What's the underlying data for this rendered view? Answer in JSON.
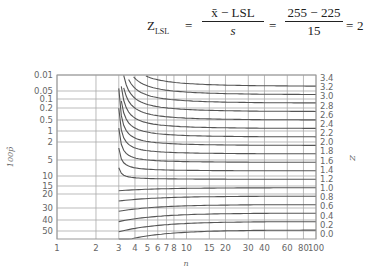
{
  "formula": {
    "lhs": "Z",
    "lhs_sub": "LSL",
    "frac1_num": "x̄ − LSL",
    "frac1_den": "s",
    "frac2_num": "255 − 225",
    "frac2_den": "15",
    "result": "2",
    "equals": "="
  },
  "chart_data": {
    "type": "line",
    "title": "",
    "xlabel": "n",
    "ylabel": "100p̂",
    "y2label": "Z",
    "x_scale": "log",
    "y_scale": "normal-probability (inverted)",
    "x_ticks": [
      "1",
      "2",
      "3",
      "4",
      "5",
      "6",
      "7",
      "8",
      "10",
      "15",
      "20",
      "30",
      "40",
      "60",
      "80",
      "100"
    ],
    "x_tick_values": [
      1,
      2,
      3,
      4,
      5,
      6,
      7,
      8,
      10,
      15,
      20,
      30,
      40,
      60,
      80,
      100
    ],
    "y_ticks": [
      "0.01",
      "0.05",
      "0.1",
      "0.2",
      "0.5",
      "1",
      "2",
      "5",
      "10",
      "15",
      "20",
      "30",
      "40",
      "50"
    ],
    "y_tick_values": [
      0.01,
      0.05,
      0.1,
      0.2,
      0.5,
      1,
      2,
      5,
      10,
      15,
      20,
      30,
      40,
      50
    ],
    "y2_ticks": [
      "3.4",
      "3.2",
      "3.0",
      "2.8",
      "2.6",
      "2.4",
      "2.2",
      "2.0",
      "1.8",
      "1.6",
      "1.4",
      "1.2",
      "1.0",
      "0.8",
      "0.6",
      "0.4",
      "0.2",
      "0.0"
    ],
    "xlim": [
      1,
      100
    ],
    "ylim": [
      0.01,
      50
    ],
    "grid": true,
    "legend": "none",
    "series_description": "One curve per Z value (0.0 to 3.4 step 0.2). Each curve starts at n=3 and approaches the asymptote 100·(1−Φ(Z)) as n→100. Curves for Z≥1.2 descend from the top; curves for Z≤1.0 rise from lower values.",
    "series": [
      {
        "name": "Z=3.4",
        "asymptote_pct": 0.034
      },
      {
        "name": "Z=3.2",
        "asymptote_pct": 0.069
      },
      {
        "name": "Z=3.0",
        "asymptote_pct": 0.135
      },
      {
        "name": "Z=2.8",
        "asymptote_pct": 0.256
      },
      {
        "name": "Z=2.6",
        "asymptote_pct": 0.466
      },
      {
        "name": "Z=2.4",
        "asymptote_pct": 0.82
      },
      {
        "name": "Z=2.2",
        "asymptote_pct": 1.39
      },
      {
        "name": "Z=2.0",
        "asymptote_pct": 2.28
      },
      {
        "name": "Z=1.8",
        "asymptote_pct": 3.59
      },
      {
        "name": "Z=1.6",
        "asymptote_pct": 5.48
      },
      {
        "name": "Z=1.4",
        "asymptote_pct": 8.08
      },
      {
        "name": "Z=1.2",
        "asymptote_pct": 11.5
      },
      {
        "name": "Z=1.0",
        "asymptote_pct": 15.9
      },
      {
        "name": "Z=0.8",
        "asymptote_pct": 21.2
      },
      {
        "name": "Z=0.6",
        "asymptote_pct": 27.4
      },
      {
        "name": "Z=0.4",
        "asymptote_pct": 34.5
      },
      {
        "name": "Z=0.2",
        "asymptote_pct": 42.1
      },
      {
        "name": "Z=0.0",
        "asymptote_pct": 50.0
      }
    ]
  }
}
